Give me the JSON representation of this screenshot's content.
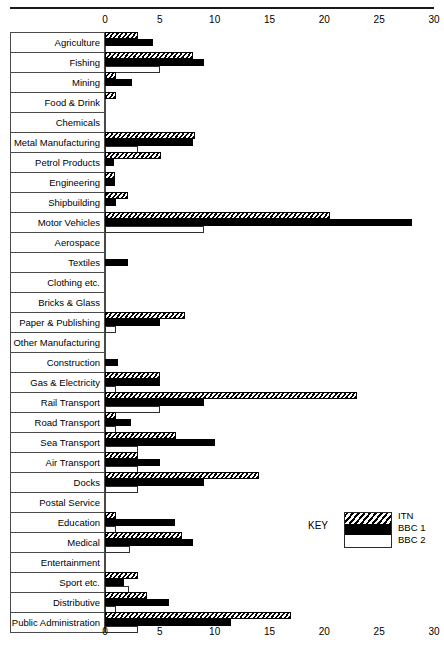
{
  "chart_data": {
    "type": "bar",
    "orientation": "horizontal",
    "title": "",
    "xlabel": "",
    "ylabel": "",
    "xlim": [
      0,
      30
    ],
    "xticks": [
      0,
      5,
      10,
      15,
      20,
      25,
      30
    ],
    "xtick_labels": [
      "0",
      "5",
      "10",
      "15",
      "20",
      "25",
      "30"
    ],
    "grid": false,
    "axis_positions": [
      "top",
      "bottom"
    ],
    "legend": {
      "title": "KEY",
      "position": "inside-right-lower",
      "entries": [
        "ITN",
        "BBC 1",
        "BBC 2"
      ]
    },
    "categories": [
      "Agriculture",
      "Fishing",
      "Mining",
      "Food & Drink",
      "Chemicals",
      "Metal Manufacturing",
      "Petrol Products",
      "Engineering",
      "Shipbuilding",
      "Motor Vehicles",
      "Aerospace",
      "Textiles",
      "Clothing etc.",
      "Bricks & Glass",
      "Paper & Publishing",
      "Other Manufacturing",
      "Construction",
      "Gas & Electricity",
      "Rail Transport",
      "Road Transport",
      "Sea Transport",
      "Air Transport",
      "Docks",
      "Postal Service",
      "Education",
      "Medical",
      "Entertainment",
      "Sport etc.",
      "Distributive",
      "Public Administration"
    ],
    "series": [
      {
        "name": "ITN",
        "pattern": "diagonal-hatch",
        "values": [
          3.0,
          8.0,
          1.0,
          1.0,
          0,
          8.2,
          5.1,
          0.9,
          2.1,
          20.5,
          0,
          0,
          0,
          0,
          7.3,
          0,
          0,
          5.0,
          23.0,
          1.0,
          6.5,
          3.0,
          14.0,
          0,
          1.0,
          7.0,
          0,
          3.0,
          3.8,
          17.0
        ]
      },
      {
        "name": "BBC 1",
        "pattern": "solid-black",
        "values": [
          4.4,
          9.0,
          2.5,
          0,
          0,
          8.0,
          0.8,
          0.9,
          1.0,
          28.0,
          0,
          2.1,
          0,
          0,
          5.0,
          0,
          1.2,
          5.0,
          9.0,
          2.4,
          10.0,
          5.0,
          9.0,
          0,
          6.4,
          8.0,
          0,
          1.7,
          5.8,
          11.5
        ]
      },
      {
        "name": "BBC 2",
        "pattern": "white-outline",
        "values": [
          0,
          5.0,
          0,
          0,
          0,
          3.0,
          0,
          0,
          0,
          9.0,
          0,
          0,
          0,
          0,
          1.0,
          0,
          0,
          1.0,
          5.0,
          1.0,
          3.0,
          3.0,
          3.0,
          0,
          1.0,
          2.3,
          0,
          2.2,
          1.0,
          3.0
        ]
      }
    ]
  },
  "legend": {
    "key_label": "KEY",
    "items": [
      {
        "label": "ITN",
        "swatch": "hatched-swatch"
      },
      {
        "label": "BBC 1",
        "swatch": "black-swatch"
      },
      {
        "label": "BBC 2",
        "swatch": "white-swatch"
      }
    ]
  }
}
